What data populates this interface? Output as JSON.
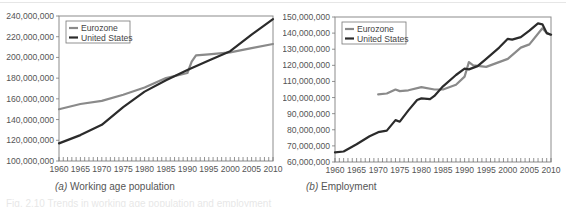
{
  "figure_caption": "Fig. 2.10  Trends in working age population and employment",
  "chart_data": [
    {
      "type": "line",
      "panel": "a",
      "title": "Working age population",
      "caption_label": "(a)",
      "caption_text": "Working age population",
      "xlabel": "",
      "ylabel": "",
      "xlim": [
        1960,
        2010
      ],
      "ylim": [
        100000000,
        240000000
      ],
      "x_ticks": [
        "1960",
        "1965",
        "1970",
        "1975",
        "1980",
        "1985",
        "1990",
        "1995",
        "2000",
        "2005",
        "2010"
      ],
      "y_ticks": [
        "100,000,000",
        "120,000,000",
        "140,000,000",
        "160,000,000",
        "180,000,000",
        "200,000,000",
        "220,000,000",
        "240,000,000"
      ],
      "grid": false,
      "legend_position": "upper-left",
      "series": [
        {
          "name": "Eurozone",
          "color": "#8a8a8a",
          "x": [
            1960,
            1965,
            1970,
            1975,
            1980,
            1985,
            1990,
            1991,
            1992,
            1995,
            2000,
            2005,
            2010
          ],
          "values": [
            150000000,
            155000000,
            158000000,
            164000000,
            171000000,
            180000000,
            185000000,
            196000000,
            202000000,
            203000000,
            205000000,
            209000000,
            213000000
          ]
        },
        {
          "name": "United States",
          "color": "#2b2b2b",
          "x": [
            1960,
            1965,
            1970,
            1975,
            1980,
            1985,
            1990,
            1995,
            2000,
            2005,
            2010
          ],
          "values": [
            117000000,
            125000000,
            135000000,
            152000000,
            167000000,
            178000000,
            188000000,
            197000000,
            206000000,
            222000000,
            237000000
          ]
        }
      ]
    },
    {
      "type": "line",
      "panel": "b",
      "title": "Employment",
      "caption_label": "(b)",
      "caption_text": "Employment",
      "xlabel": "",
      "ylabel": "",
      "xlim": [
        1960,
        2010
      ],
      "ylim": [
        60000000,
        150000000
      ],
      "x_ticks": [
        "1960",
        "1965",
        "1970",
        "1975",
        "1980",
        "1985",
        "1990",
        "1995",
        "2000",
        "2005",
        "2010"
      ],
      "y_ticks": [
        "60,000,000",
        "70,000,000",
        "80,000,000",
        "90,000,000",
        "100,000,000",
        "110,000,000",
        "120,000,000",
        "130,000,000",
        "140,000,000",
        "150,000,000"
      ],
      "grid": false,
      "legend_position": "upper-left",
      "series": [
        {
          "name": "Eurozone",
          "color": "#8a8a8a",
          "x": [
            1970,
            1972,
            1974,
            1975,
            1977,
            1980,
            1983,
            1985,
            1988,
            1990,
            1991,
            1992,
            1995,
            2000,
            2003,
            2005,
            2008,
            2009,
            2010
          ],
          "values": [
            102000000,
            102500000,
            105000000,
            104000000,
            104500000,
            106500000,
            105000000,
            105000000,
            108000000,
            113000000,
            122000000,
            120000000,
            119000000,
            124000000,
            131000000,
            133000000,
            143000000,
            140000000,
            139000000
          ]
        },
        {
          "name": "United States",
          "color": "#2b2b2b",
          "x": [
            1960,
            1962,
            1965,
            1968,
            1970,
            1972,
            1974,
            1975,
            1977,
            1979,
            1980,
            1982,
            1983,
            1985,
            1988,
            1990,
            1991,
            1993,
            1995,
            1998,
            2000,
            2001,
            2003,
            2005,
            2007,
            2008,
            2009,
            2010
          ],
          "values": [
            66000000,
            66500000,
            71000000,
            76000000,
            78500000,
            79500000,
            86000000,
            85000000,
            92000000,
            98500000,
            99500000,
            99000000,
            101000000,
            107000000,
            114000000,
            118000000,
            117500000,
            119500000,
            124000000,
            131000000,
            136500000,
            136000000,
            137500000,
            141500000,
            146000000,
            145500000,
            140000000,
            139000000
          ]
        }
      ]
    }
  ]
}
